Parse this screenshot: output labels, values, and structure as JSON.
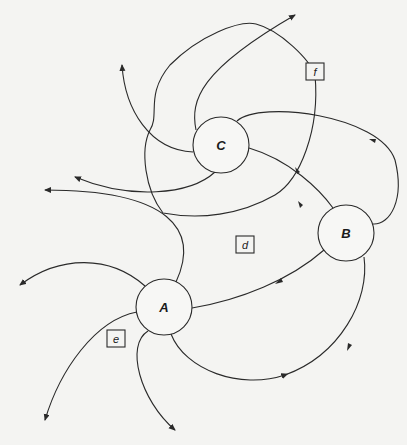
{
  "figure": {
    "nodes": [
      {
        "id": "A",
        "label": "A",
        "cx": 164,
        "cy": 307,
        "r": 28
      },
      {
        "id": "B",
        "label": "B",
        "cx": 346,
        "cy": 233,
        "r": 28
      },
      {
        "id": "C",
        "label": "C",
        "cx": 221,
        "cy": 145,
        "r": 28
      }
    ],
    "regions": [
      {
        "id": "d",
        "label": "d",
        "x": 230,
        "y": 238,
        "w": 18,
        "h": 16
      },
      {
        "id": "e",
        "label": "e",
        "x": 106,
        "y": 330,
        "w": 18,
        "h": 16
      },
      {
        "id": "f",
        "label": "f",
        "x": 306,
        "y": 63,
        "w": 18,
        "h": 16
      }
    ],
    "colors": {
      "line": "#2a2a2a",
      "background": "#f4f4f2"
    }
  }
}
